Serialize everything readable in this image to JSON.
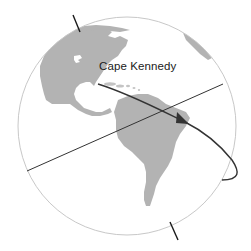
{
  "diagram": {
    "type": "globe-trajectory",
    "labels": {
      "launch_site": "Cape Kennedy"
    },
    "colors": {
      "land": "#b3b3b3",
      "globe_outline": "#c8c8c8",
      "axis": "#1a1a1a",
      "equator": "#333333",
      "trajectory": "#333333",
      "background": "#ffffff"
    },
    "elements": [
      "globe",
      "rotation-axis",
      "equator-line",
      "north-america",
      "south-america",
      "trajectory-arrow"
    ]
  }
}
